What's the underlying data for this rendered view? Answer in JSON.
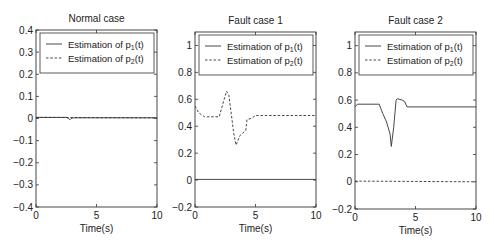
{
  "chart_data": [
    {
      "type": "line",
      "title": "Normal case",
      "xlabel": "Time(s)",
      "ylabel": "",
      "xlim": [
        0,
        10
      ],
      "ylim": [
        -0.4,
        0.4
      ],
      "xticks": [
        "0",
        "5",
        "10"
      ],
      "yticks": [
        "0.4",
        "0.3",
        "0.2",
        "0.1",
        "0",
        "-0.1",
        "-0.2",
        "-0.3",
        "-0.4"
      ],
      "grid": false,
      "legend_position": "upper right",
      "series": [
        {
          "name": "Estimation of p1(t)",
          "style": "solid",
          "x": [
            0,
            2.5,
            2.7,
            2.8,
            2.9,
            3.1,
            10
          ],
          "y": [
            0.005,
            0.005,
            0.0,
            -0.006,
            0.0,
            0.003,
            0.003
          ]
        },
        {
          "name": "Estimation of p2(t)",
          "style": "dashed",
          "x": [
            0,
            10
          ],
          "y": [
            0.005,
            0.003
          ]
        }
      ]
    },
    {
      "type": "line",
      "title": "Fault case 1",
      "xlabel": "Time(s)",
      "ylabel": "",
      "xlim": [
        0,
        10
      ],
      "ylim": [
        -0.2,
        1.1
      ],
      "xticks": [
        "0",
        "5",
        "10"
      ],
      "yticks": [
        "1",
        "0.8",
        "0.6",
        "0.4",
        "0.2",
        "0",
        "-0.2"
      ],
      "grid": false,
      "legend_position": "upper right",
      "series": [
        {
          "name": "Estimation of p1(t)",
          "style": "solid",
          "x": [
            0,
            10
          ],
          "y": [
            0.005,
            0.005
          ]
        },
        {
          "name": "Estimation of p2(t)",
          "style": "dashed",
          "x": [
            0,
            0.3,
            0.8,
            2.0,
            2.6,
            2.8,
            3.2,
            3.4,
            3.7,
            4.2,
            4.3,
            4.7,
            5.0,
            10
          ],
          "y": [
            0.55,
            0.5,
            0.47,
            0.47,
            0.66,
            0.63,
            0.35,
            0.26,
            0.33,
            0.37,
            0.45,
            0.46,
            0.48,
            0.48
          ]
        }
      ]
    },
    {
      "type": "line",
      "title": "Fault case 2",
      "xlabel": "Time(s)",
      "ylabel": "",
      "xlim": [
        0,
        10
      ],
      "ylim": [
        -0.2,
        1.1
      ],
      "xticks": [
        "0",
        "5",
        "10"
      ],
      "yticks": [
        "1",
        "0.8",
        "0.6",
        "0.4",
        "0.2",
        "0",
        "-0.2"
      ],
      "grid": false,
      "legend_position": "upper right",
      "series": [
        {
          "name": "Estimation of p1(t)",
          "style": "solid",
          "x": [
            0,
            0.2,
            0.5,
            2.0,
            2.3,
            2.6,
            2.9,
            3.0,
            3.2,
            3.4,
            3.5,
            3.9,
            4.1,
            4.3,
            10
          ],
          "y": [
            0.55,
            0.57,
            0.57,
            0.57,
            0.5,
            0.44,
            0.35,
            0.26,
            0.4,
            0.6,
            0.61,
            0.6,
            0.59,
            0.55,
            0.55
          ]
        },
        {
          "name": "Estimation of p2(t)",
          "style": "dashed",
          "x": [
            0,
            10
          ],
          "y": [
            0.005,
            0.0
          ]
        }
      ]
    }
  ],
  "legend": {
    "p1_prefix": "Estimation of p",
    "p1_sub": "1",
    "p1_suffix": "(t)",
    "p2_prefix": "Estimation of p",
    "p2_sub": "2",
    "p2_suffix": "(t)"
  },
  "panels": [
    {
      "title": "Normal case",
      "xlabel": "Time(s)"
    },
    {
      "title": "Fault case 1",
      "xlabel": "Time(s)"
    },
    {
      "title": "Fault case 2",
      "xlabel": "Time(s)"
    }
  ]
}
